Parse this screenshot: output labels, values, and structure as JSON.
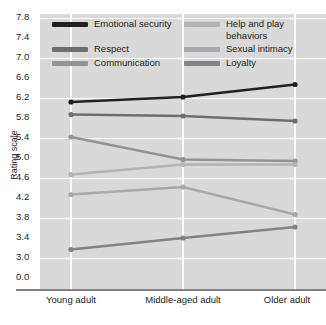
{
  "chart_data": {
    "type": "line",
    "title": "",
    "xlabel": "",
    "ylabel": "Rating scale",
    "categories": [
      "Young adult",
      "Middle-aged adult",
      "Older adult"
    ],
    "ylim": [
      3.0,
      7.8
    ],
    "yticks": [
      "7.8",
      "7.4",
      "7.0",
      "6.6",
      "6.2",
      "5.8",
      "5.4",
      "5.0",
      "4.6",
      "4.2",
      "3.8",
      "3.4",
      "3.0",
      "0.0"
    ],
    "ytick_values": [
      7.8,
      7.4,
      7.0,
      6.6,
      6.2,
      5.8,
      5.4,
      5.0,
      4.6,
      4.2,
      3.8,
      3.4,
      3.0,
      0.0
    ],
    "axis_broken": true,
    "grid": true,
    "legend_position": "top-inside",
    "series": [
      {
        "name": "Emotional security",
        "values": [
          6.1,
          6.2,
          6.45
        ],
        "color": "#231f20"
      },
      {
        "name": "Respect",
        "values": [
          5.85,
          5.82,
          5.72
        ],
        "color": "#6d6e70"
      },
      {
        "name": "Communication",
        "values": [
          5.4,
          4.95,
          4.92
        ],
        "color": "#929497"
      },
      {
        "name": "Help and play behaviors",
        "values": [
          4.65,
          4.85,
          4.85
        ],
        "color": "#b1b3b5"
      },
      {
        "name": "Sexual intimacy",
        "values": [
          4.25,
          4.4,
          3.85
        ],
        "color": "#a7a9ac"
      },
      {
        "name": "Loyalty",
        "values": [
          3.15,
          3.38,
          3.6
        ],
        "color": "#808285"
      }
    ]
  },
  "legend": {
    "column_left": [
      "Emotional security",
      "Respect",
      "Communication"
    ],
    "column_right": [
      "Help and play behaviors",
      "Sexual intimacy",
      "Loyalty"
    ]
  },
  "colors": {
    "plot_background": "#d9d9d9",
    "page_background": "#ffffff",
    "gridline": "#ffffff",
    "axis": "#808080",
    "text": "#231f20"
  }
}
